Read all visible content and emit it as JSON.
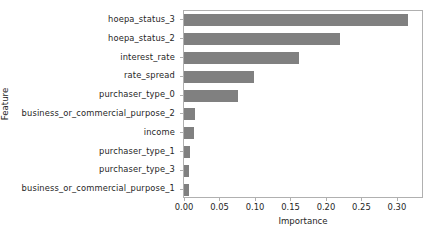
{
  "chart_data": {
    "type": "bar",
    "orientation": "horizontal",
    "title": "",
    "xlabel": "Importance",
    "ylabel": "Feature",
    "categories": [
      "hoepa_status_3",
      "hoepa_status_2",
      "interest_rate",
      "rate_spread",
      "purchaser_type_0",
      "business_or_commercial_purpose_2",
      "income",
      "purchaser_type_1",
      "purchaser_type_3",
      "business_or_commercial_purpose_1"
    ],
    "values": [
      0.315,
      0.22,
      0.162,
      0.098,
      0.076,
      0.016,
      0.014,
      0.008,
      0.0075,
      0.007
    ],
    "xlim": [
      0.0,
      0.3353
    ],
    "xticks": [
      0.0,
      0.05,
      0.1,
      0.15,
      0.2,
      0.25,
      0.3
    ],
    "xtick_labels": [
      "0.00",
      "0.05",
      "0.10",
      "0.15",
      "0.20",
      "0.25",
      "0.30"
    ],
    "grid": false,
    "legend": null,
    "bar_color": "#808080",
    "axes_color": "#b0b0b0",
    "text_color": "#262626"
  }
}
